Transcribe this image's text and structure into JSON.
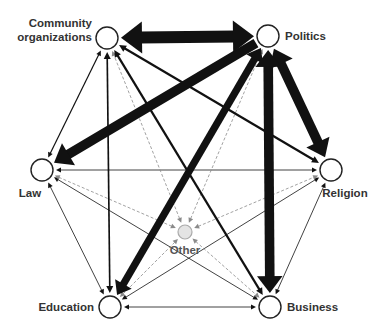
{
  "diagram": {
    "colors": {
      "edge": "#111111",
      "edge_dashed": "#8a8a8a",
      "node_stroke": "#222222",
      "node_fill": "#ffffff",
      "other_fill": "#e4e4e4",
      "other_stroke": "#aaaaaa"
    },
    "nodes": [
      {
        "id": "community",
        "label_lines": [
          "Community",
          "organizations"
        ]
      },
      {
        "id": "politics",
        "label_lines": [
          "Politics"
        ]
      },
      {
        "id": "law",
        "label_lines": [
          "Law"
        ]
      },
      {
        "id": "religion",
        "label_lines": [
          "Religion"
        ]
      },
      {
        "id": "education",
        "label_lines": [
          "Education"
        ]
      },
      {
        "id": "business",
        "label_lines": [
          "Business"
        ]
      },
      {
        "id": "other",
        "label_lines": [
          "Other"
        ]
      }
    ],
    "edges": [
      {
        "from": "community",
        "to": "politics",
        "weight": 5,
        "style": "solid",
        "bidirectional": true
      },
      {
        "from": "politics",
        "to": "law",
        "weight": 4,
        "style": "solid",
        "bidirectional": false
      },
      {
        "from": "politics",
        "to": "religion",
        "weight": 4,
        "style": "solid",
        "bidirectional": true
      },
      {
        "from": "politics",
        "to": "business",
        "weight": 4,
        "style": "solid",
        "bidirectional": true
      },
      {
        "from": "politics",
        "to": "education",
        "weight": 3,
        "style": "solid",
        "bidirectional": true
      },
      {
        "from": "community",
        "to": "religion",
        "weight": 2,
        "style": "solid",
        "bidirectional": true
      },
      {
        "from": "community",
        "to": "business",
        "weight": 2,
        "style": "solid",
        "bidirectional": true
      },
      {
        "from": "community",
        "to": "education",
        "weight": 1.5,
        "style": "solid",
        "bidirectional": true
      },
      {
        "from": "community",
        "to": "law",
        "weight": 1.2,
        "style": "solid",
        "bidirectional": true
      },
      {
        "from": "religion",
        "to": "law",
        "weight": 0.8,
        "style": "solid",
        "bidirectional": true
      },
      {
        "from": "business",
        "to": "law",
        "weight": 0.8,
        "style": "solid",
        "bidirectional": true
      },
      {
        "from": "education",
        "to": "religion",
        "weight": 0.8,
        "style": "solid",
        "bidirectional": true
      },
      {
        "from": "business",
        "to": "education",
        "weight": 0.8,
        "style": "solid",
        "bidirectional": true
      },
      {
        "from": "law",
        "to": "education",
        "weight": 0.8,
        "style": "solid",
        "bidirectional": true
      },
      {
        "from": "religion",
        "to": "business",
        "weight": 0.8,
        "style": "solid",
        "bidirectional": true
      },
      {
        "from": "other",
        "to": "community",
        "weight": 0.8,
        "style": "dashed",
        "bidirectional": true
      },
      {
        "from": "other",
        "to": "politics",
        "weight": 0.8,
        "style": "dashed",
        "bidirectional": true
      },
      {
        "from": "other",
        "to": "law",
        "weight": 0.8,
        "style": "dashed",
        "bidirectional": true
      },
      {
        "from": "other",
        "to": "religion",
        "weight": 0.8,
        "style": "dashed",
        "bidirectional": true
      },
      {
        "from": "other",
        "to": "education",
        "weight": 0.8,
        "style": "dashed",
        "bidirectional": true
      },
      {
        "from": "other",
        "to": "business",
        "weight": 0.8,
        "style": "dashed",
        "bidirectional": true
      }
    ]
  }
}
